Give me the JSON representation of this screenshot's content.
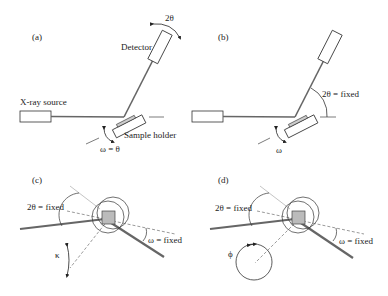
{
  "panels": {
    "a": {
      "label": "(a)",
      "detector": "Detector",
      "two_theta": "2θ",
      "source": "X-ray source",
      "sample_holder": "Sample holder",
      "omega": "ω = θ"
    },
    "b": {
      "label": "(b)",
      "two_theta": "2θ = fixed",
      "omega": "ω"
    },
    "c": {
      "label": "(c)",
      "two_theta": "2θ = fixed",
      "omega": "ω = fixed",
      "kappa": "κ"
    },
    "d": {
      "label": "(d)",
      "two_theta": "2θ = fixed",
      "omega": "ω = fixed",
      "phi": "ϕ"
    }
  },
  "colors": {
    "line": "#333333",
    "beam": "#666666",
    "sample": "#bbbbbb",
    "dashed": "#555555"
  }
}
